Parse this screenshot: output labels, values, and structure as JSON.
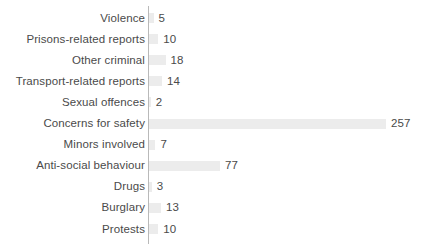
{
  "chart_data": {
    "type": "bar",
    "orientation": "horizontal",
    "title": "",
    "subtitle": "",
    "xlabel": "",
    "ylabel": "",
    "grid": false,
    "legend": null,
    "axis_visible": true,
    "value_labels_shown": true,
    "xlim": [
      0,
      257
    ],
    "categories": [
      "Violence",
      "Prisons-related reports",
      "Other criminal",
      "Transport-related reports",
      "Sexual offences",
      "Concerns for safety",
      "Minors involved",
      "Anti-social behaviour",
      "Drugs",
      "Burglary",
      "Protests"
    ],
    "values": [
      5,
      10,
      18,
      14,
      2,
      257,
      7,
      77,
      3,
      13,
      10
    ],
    "colors": {
      "bar": "#ececec",
      "axis": "#b9b9b9",
      "text": "#4a4a4a",
      "background": "#ffffff"
    }
  }
}
